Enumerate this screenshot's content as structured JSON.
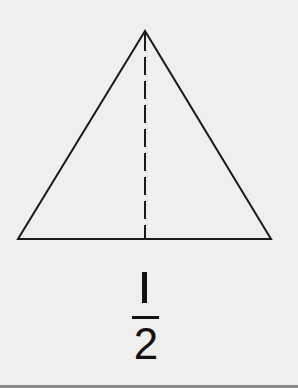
{
  "diagram": {
    "shape": "triangle",
    "triangle": {
      "apex": [
        145,
        31
      ],
      "base_left": [
        18,
        239
      ],
      "base_right": [
        271,
        239
      ],
      "stroke_color": "#1a1a1a"
    },
    "dashed_line": {
      "from": [
        145,
        32
      ],
      "to": [
        145,
        239
      ],
      "dash": "18 6",
      "color": "#1a1a1a",
      "meaning": "line of symmetry dividing triangle into two equal halves"
    }
  },
  "fraction": {
    "numerator": "1",
    "denominator": "2",
    "text": "1/2"
  },
  "colors": {
    "background": "#efefed",
    "ink": "#111111",
    "border": "#8a8a88"
  }
}
